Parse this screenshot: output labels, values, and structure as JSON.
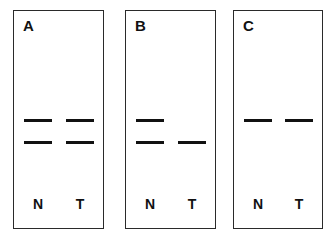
{
  "figure": {
    "panels": [
      {
        "label": "A",
        "lanes": [
          {
            "label": "N",
            "bands": [
              "upper",
              "lower"
            ]
          },
          {
            "label": "T",
            "bands": [
              "upper",
              "lower"
            ]
          }
        ]
      },
      {
        "label": "B",
        "lanes": [
          {
            "label": "N",
            "bands": [
              "upper",
              "lower"
            ]
          },
          {
            "label": "T",
            "bands": [
              "lower"
            ]
          }
        ]
      },
      {
        "label": "C",
        "lanes": [
          {
            "label": "N",
            "bands": [
              "upper"
            ]
          },
          {
            "label": "T",
            "bands": [
              "upper"
            ]
          }
        ]
      }
    ],
    "colors": {
      "band": "#111111",
      "border": "#2a2a2a",
      "background": "#ffffff"
    }
  }
}
